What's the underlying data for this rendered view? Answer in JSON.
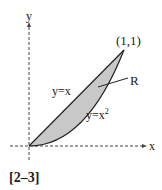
{
  "diagram": {
    "axes": {
      "x_label": "x",
      "y_label": "y"
    },
    "point_label": "(1,1)",
    "region_label": "R",
    "curves": [
      {
        "name": "line",
        "label": "y=x"
      },
      {
        "name": "parabola",
        "label_base": "y=x",
        "label_exp": "2"
      }
    ],
    "fill_color": "#c8c8c8",
    "caption": "[2–3]"
  }
}
